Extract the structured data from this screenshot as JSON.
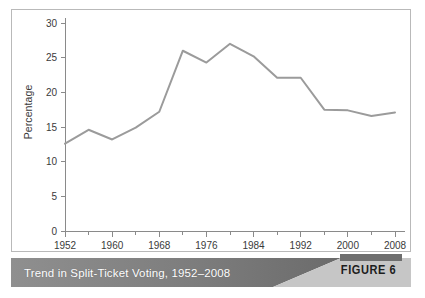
{
  "caption": {
    "title": "Trend in Split-Ticket Voting, 1952–2008",
    "figure_label": "FIGURE 6",
    "bar_color_dark": "#6e6e6e",
    "bar_color_light": "#bdbdbd"
  },
  "chart_data": {
    "type": "line",
    "title": "Trend in Split-Ticket Voting, 1952–2008",
    "xlabel": "",
    "ylabel": "Percentage",
    "x": [
      1952,
      1956,
      1960,
      1964,
      1968,
      1972,
      1976,
      1980,
      1984,
      1988,
      1992,
      1996,
      2000,
      2004,
      2008
    ],
    "values": [
      12.6,
      14.6,
      13.2,
      14.9,
      17.2,
      26.0,
      24.3,
      27.0,
      25.2,
      22.1,
      22.1,
      17.5,
      17.4,
      16.6,
      17.1
    ],
    "series": [
      {
        "name": "Split-ticket voting",
        "values": [
          12.6,
          14.6,
          13.2,
          14.9,
          17.2,
          26.0,
          24.3,
          27.0,
          25.2,
          22.1,
          22.1,
          17.5,
          17.4,
          16.6,
          17.1
        ]
      }
    ],
    "xlim": [
      1952,
      2008
    ],
    "ylim": [
      0,
      30
    ],
    "ytick_labels": [
      "0",
      "5",
      "10",
      "15",
      "20",
      "25",
      "30"
    ],
    "yticks": [
      0,
      5,
      10,
      15,
      20,
      25,
      30
    ],
    "xtick_labels": [
      "1952",
      "1960",
      "1968",
      "1976",
      "1984",
      "1992",
      "2000",
      "2008"
    ],
    "xticks_major": [
      1952,
      1960,
      1968,
      1976,
      1984,
      1992,
      2000,
      2008
    ],
    "xticks_minor": [
      1956,
      1964,
      1972,
      1980,
      1988,
      1996,
      2004
    ],
    "grid": false,
    "legend": "none",
    "line_color": "#9b9b9b",
    "axis_color": "#8a8a8a"
  }
}
